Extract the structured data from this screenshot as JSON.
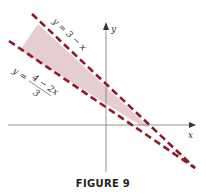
{
  "figure": {
    "caption": "FIGURE 9",
    "axes": {
      "x_label": "x",
      "y_label": "y"
    },
    "lines": [
      {
        "id": "upper",
        "label": "y = 3 − x",
        "style": "dashed",
        "color": "#8b1a2b"
      },
      {
        "id": "lower",
        "label_top": "y = ",
        "label_num": "4 − 2x",
        "label_den": "3",
        "style": "dashed",
        "color": "#8b1a2b"
      }
    ],
    "region": {
      "fill": "#e2c4c9",
      "description": "shaded region between the two lines"
    }
  }
}
